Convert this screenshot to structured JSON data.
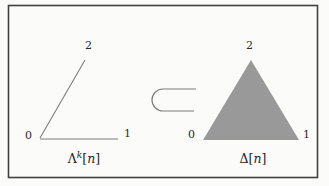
{
  "diagram": {
    "left_figure": {
      "type": "horn-outline",
      "caption": {
        "base": "Λ",
        "sup": "k",
        "open": "[",
        "var": "n",
        "close": "]"
      },
      "vertices": {
        "v0": "0",
        "v1": "1",
        "v2": "2"
      }
    },
    "relation": {
      "symbol": "⊂",
      "name": "subset-inclusion"
    },
    "right_figure": {
      "type": "filled-simplex",
      "caption": {
        "base": "Δ",
        "open": "[",
        "var": "n",
        "close": "]"
      },
      "vertices": {
        "v0": "0",
        "v1": "1",
        "v2": "2"
      }
    },
    "colors": {
      "triangle_fill": "#999999",
      "line": "#7d7d7d",
      "frame": "#414141",
      "text": "#1e1e1e"
    }
  }
}
